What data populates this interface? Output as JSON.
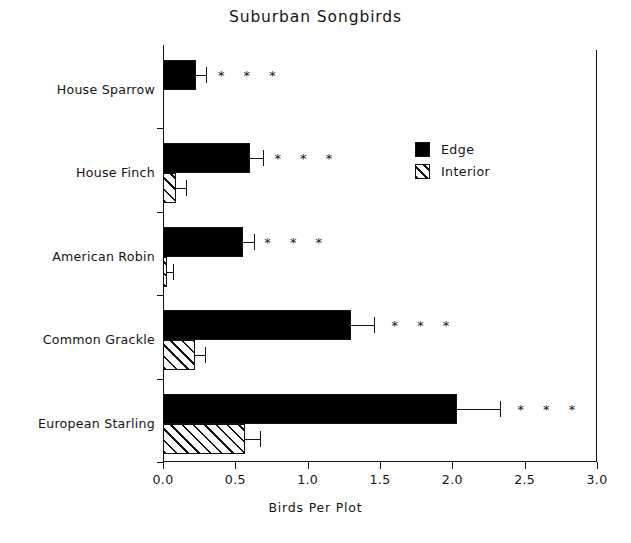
{
  "chart_data": {
    "type": "bar",
    "orientation": "horizontal",
    "title": "Suburban Songbirds",
    "xlabel": "Birds Per Plot",
    "ylabel": "",
    "xlim": [
      0.0,
      3.0
    ],
    "xticks": [
      "0.0",
      "0.5",
      "1.0",
      "1.5",
      "2.0",
      "2.5",
      "3.0"
    ],
    "xtick_values": [
      0.0,
      0.5,
      1.0,
      1.5,
      2.0,
      2.5,
      3.0
    ],
    "grid": false,
    "legend_position": "upper right",
    "categories": [
      "House Sparrow",
      "House Finch",
      "American Robin",
      "Common Grackle",
      "European Starling"
    ],
    "series": [
      {
        "name": "Edge",
        "fill": "solid-black",
        "values": [
          0.23,
          0.6,
          0.55,
          1.3,
          2.03
        ],
        "errors": [
          0.07,
          0.09,
          0.08,
          0.16,
          0.3
        ]
      },
      {
        "name": "Interior",
        "fill": "hatched",
        "values": [
          0.0,
          0.09,
          0.03,
          0.22,
          0.57
        ],
        "errors": [
          0.0,
          0.07,
          0.04,
          0.07,
          0.1
        ]
      }
    ],
    "annotations": [
      {
        "category": "House Sparrow",
        "text": "* * *",
        "x": 0.38
      },
      {
        "category": "House Finch",
        "text": "* * *",
        "x": 0.77
      },
      {
        "category": "American Robin",
        "text": "* * *",
        "x": 0.7
      },
      {
        "category": "Common Grackle",
        "text": "* * *",
        "x": 1.58
      },
      {
        "category": "European Starling",
        "text": "* * *",
        "x": 2.45
      }
    ]
  },
  "legend": {
    "items": [
      {
        "label": "Edge",
        "swatch": "solid"
      },
      {
        "label": "Interior",
        "swatch": "hatch"
      }
    ]
  }
}
